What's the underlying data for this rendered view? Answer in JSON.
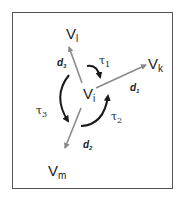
{
  "diagram": {
    "nodes": {
      "center": {
        "base": "V",
        "sub": "i"
      },
      "top": {
        "base": "V",
        "sub": "l"
      },
      "right": {
        "base": "V",
        "sub": "k"
      },
      "bottom": {
        "base": "V",
        "sub": "m"
      }
    },
    "edges": {
      "d1": {
        "base": "d",
        "sub": "1",
        "from": "V_i",
        "to": "V_k"
      },
      "d2": {
        "base": "d",
        "sub": "2",
        "from": "V_i",
        "to": "V_m"
      },
      "d3": {
        "base": "d",
        "sub": "3",
        "from": "V_i",
        "to": "V_l"
      }
    },
    "rotations": {
      "tau1": {
        "base": "τ",
        "sub": "1"
      },
      "tau2": {
        "base": "τ",
        "sub": "2"
      },
      "tau3": {
        "base": "τ",
        "sub": "3"
      }
    },
    "colors": {
      "edge": "#8a8a8a",
      "rotation": "#1a1a1a",
      "frame": "#555555",
      "text": "#222222"
    }
  }
}
